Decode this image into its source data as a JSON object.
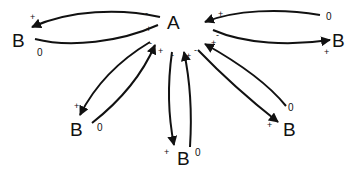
{
  "diagram": {
    "center": {
      "label": "A",
      "x": 175,
      "y": 29
    },
    "nodes": [
      {
        "id": "b_left",
        "label": "B",
        "x": 12,
        "y": 47,
        "zero": "0",
        "zx": 37,
        "zy": 53
      },
      {
        "id": "b_right",
        "label": "B",
        "x": 332,
        "y": 47,
        "zero": "0",
        "zx": 326,
        "zy": 20
      },
      {
        "id": "b_lower_left",
        "label": "B",
        "x": 70,
        "y": 136,
        "zero": "0",
        "zx": 97,
        "zy": 128
      },
      {
        "id": "b_bottom",
        "label": "B",
        "x": 177,
        "y": 165,
        "zero": "0",
        "zx": 195,
        "zy": 153
      },
      {
        "id": "b_lower_right",
        "label": "B",
        "x": 283,
        "y": 136,
        "zero": "0",
        "zx": 288,
        "zy": 111
      }
    ],
    "marks": {
      "plus": "+",
      "minus": "-"
    }
  }
}
